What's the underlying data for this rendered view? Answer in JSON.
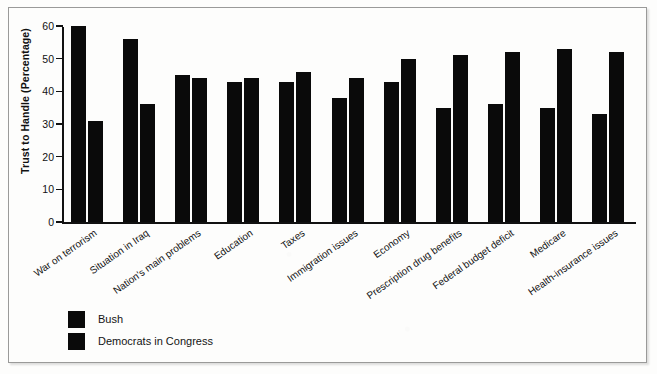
{
  "chart_data": {
    "type": "bar",
    "title": "",
    "xlabel": "",
    "ylabel": "Trust to Handle (Percentage)",
    "ylim": [
      0,
      60
    ],
    "yticks": [
      0,
      10,
      20,
      30,
      40,
      50,
      60
    ],
    "grid": false,
    "legend_position": "bottom-left",
    "categories": [
      "War on terrorism",
      "Situation in Iraq",
      "Nation's main problems",
      "Education",
      "Taxes",
      "Immigration issues",
      "Economy",
      "Prescription drug benefits",
      "Federal budget deficit",
      "Medicare",
      "Health-insurance issues"
    ],
    "series": [
      {
        "name": "Bush",
        "color": "#0a0a0a",
        "values": [
          60,
          56,
          45,
          43,
          43,
          38,
          43,
          35,
          36,
          35,
          33
        ]
      },
      {
        "name": "Democrats in Congress",
        "color": "#0a0a0a",
        "values": [
          31,
          36,
          44,
          44,
          46,
          44,
          50,
          51,
          52,
          53,
          52
        ]
      }
    ]
  },
  "legend": {
    "entries": [
      {
        "label": "Bush"
      },
      {
        "label": "Democrats in Congress"
      }
    ]
  }
}
